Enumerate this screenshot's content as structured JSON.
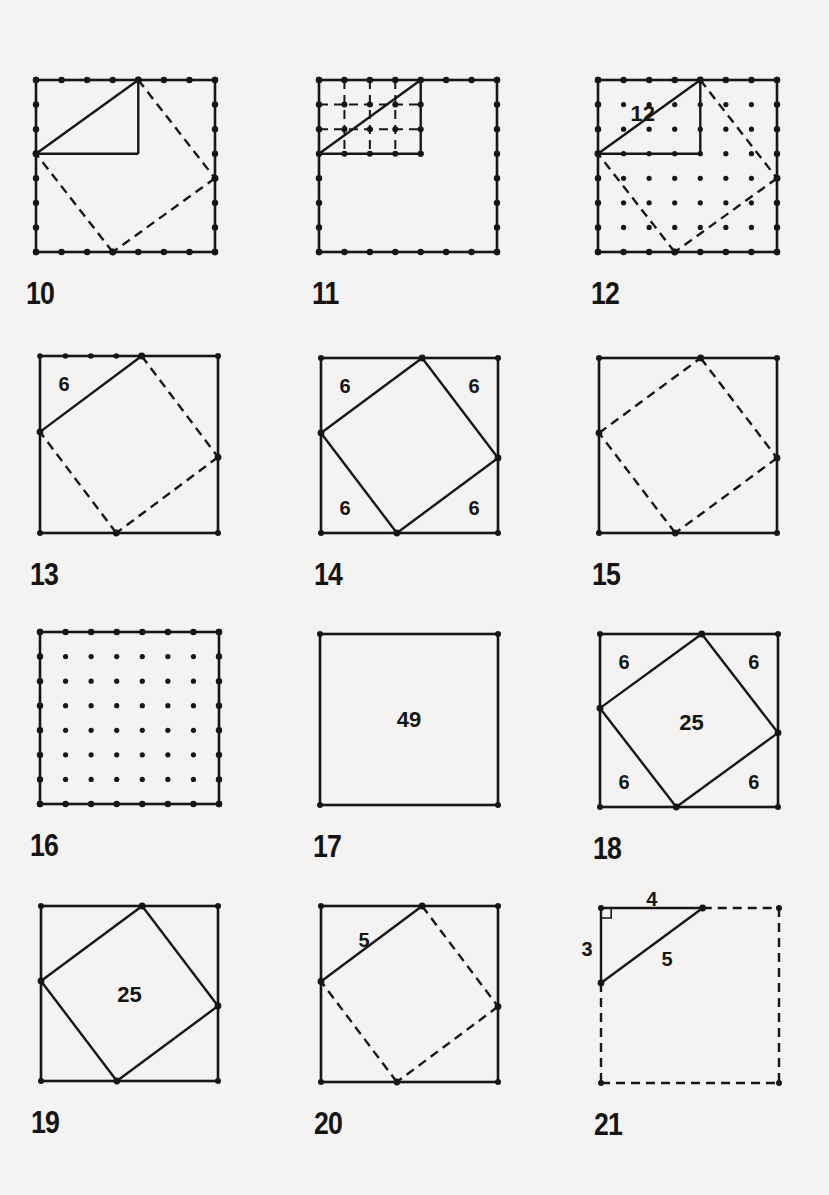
{
  "page": {
    "background": "#f4f3f1",
    "ink": "#161616",
    "grid_units": 7
  },
  "panels": [
    {
      "number": "10",
      "box": {
        "x": 36,
        "y": 80,
        "w": 179,
        "h": 172
      },
      "edge_dots": true,
      "interior_dots": false,
      "triangle": {
        "legs": [
          4,
          3
        ],
        "rect_guides": true
      },
      "tilted_square": "dashed",
      "labels": []
    },
    {
      "number": "11",
      "box": {
        "x": 319,
        "y": 80,
        "w": 178,
        "h": 172
      },
      "edge_dots": true,
      "interior_dots": false,
      "unit_grid": {
        "cols": 4,
        "rows": 3,
        "style": "dashed"
      },
      "diagonal": true,
      "labels": []
    },
    {
      "number": "12",
      "box": {
        "x": 598,
        "y": 80,
        "w": 179,
        "h": 172
      },
      "edge_dots": true,
      "interior_dots": true,
      "triangle": {
        "legs": [
          4,
          3
        ],
        "rect_guides": true
      },
      "tilted_square": "dashed",
      "labels": [
        {
          "text": "12",
          "u": 1.75,
          "v": 1.35
        }
      ]
    },
    {
      "number": "13",
      "box": {
        "x": 40,
        "y": 356,
        "w": 178,
        "h": 177
      },
      "edge_dots": "top-partial",
      "interior_dots": false,
      "tilted_square": "first-side-solid",
      "labels": [
        {
          "text": "6",
          "u": 0.95,
          "v": 1.1
        }
      ]
    },
    {
      "number": "14",
      "box": {
        "x": 321,
        "y": 358,
        "w": 177,
        "h": 175
      },
      "corner_dots": true,
      "tilted_square": "solid",
      "labels": [
        {
          "text": "6",
          "u": 0.95,
          "v": 1.1
        },
        {
          "text": "6",
          "u": 6.05,
          "v": 1.1
        },
        {
          "text": "6",
          "u": 0.95,
          "v": 6.0
        },
        {
          "text": "6",
          "u": 6.05,
          "v": 6.0
        }
      ]
    },
    {
      "number": "15",
      "box": {
        "x": 599,
        "y": 358,
        "w": 178,
        "h": 175
      },
      "corner_dots": true,
      "tilted_square": "dashed",
      "labels": []
    },
    {
      "number": "16",
      "box": {
        "x": 40,
        "y": 632,
        "w": 179,
        "h": 172
      },
      "edge_dots": true,
      "interior_dots": true,
      "labels": []
    },
    {
      "number": "17",
      "box": {
        "x": 320,
        "y": 634,
        "w": 178,
        "h": 171
      },
      "corner_dots": true,
      "labels": [
        {
          "text": "49",
          "u": 3.5,
          "v": 3.5
        }
      ]
    },
    {
      "number": "18",
      "box": {
        "x": 600,
        "y": 634,
        "w": 178,
        "h": 173
      },
      "corner_dots": true,
      "tilted_square": "solid",
      "labels": [
        {
          "text": "6",
          "u": 0.95,
          "v": 1.15
        },
        {
          "text": "6",
          "u": 6.05,
          "v": 1.15
        },
        {
          "text": "6",
          "u": 0.95,
          "v": 6.0
        },
        {
          "text": "6",
          "u": 6.05,
          "v": 6.0
        },
        {
          "text": "25",
          "u": 3.6,
          "v": 3.6
        }
      ]
    },
    {
      "number": "19",
      "box": {
        "x": 41,
        "y": 906,
        "w": 177,
        "h": 175
      },
      "corner_dots": true,
      "tilted_square": "solid",
      "labels": [
        {
          "text": "25",
          "u": 3.5,
          "v": 3.55
        }
      ]
    },
    {
      "number": "20",
      "box": {
        "x": 321,
        "y": 906,
        "w": 177,
        "h": 176
      },
      "corner_dots": true,
      "tilted_square": "first-side-solid",
      "labels": [
        {
          "text": "5",
          "u": 1.7,
          "v": 1.35
        }
      ]
    },
    {
      "number": "21",
      "box": {
        "x": 601,
        "y": 908,
        "w": 178,
        "h": 175
      },
      "dashed_box": true,
      "triangle": {
        "legs": [
          4,
          3
        ],
        "right_angle_mark": true
      },
      "labels": [
        {
          "text": "4",
          "u": 2.0,
          "v": -0.35
        },
        {
          "text": "3",
          "u": -0.55,
          "v": 1.65
        },
        {
          "text": "5",
          "u": 2.6,
          "v": 2.05
        }
      ]
    }
  ]
}
